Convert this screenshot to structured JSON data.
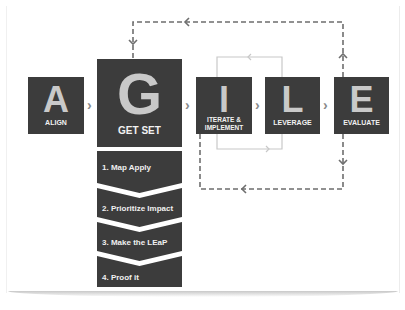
{
  "diagram": {
    "stages": [
      {
        "letter": "A",
        "label": "ALIGN"
      },
      {
        "letter": "G",
        "label": "GET SET"
      },
      {
        "letter": "I",
        "label_line1": "ITERATE &",
        "label_line2": "IMPLEMENT"
      },
      {
        "letter": "L",
        "label": "LEVERAGE"
      },
      {
        "letter": "E",
        "label": "EVALUATE"
      }
    ],
    "connector_glyph": "›",
    "get_set_steps": [
      "1. Map Apply",
      "2. Prioritize Impact",
      "3. Make the LEaP",
      "4. Proof it"
    ],
    "colors": {
      "box": "#3c3c3c",
      "letter": "#c9c9c9",
      "dashed_loop": "#6e6e6e",
      "inner_loop": "#c8c8c8"
    }
  }
}
